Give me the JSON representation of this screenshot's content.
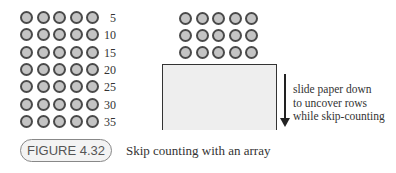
{
  "left_array": {
    "rows": 7,
    "cols": 5,
    "row_labels": [
      "5",
      "10",
      "15",
      "20",
      "25",
      "30",
      "35"
    ]
  },
  "right_array": {
    "visible_rows": 3,
    "cols": 5
  },
  "annotation": {
    "lines": [
      "slide paper down",
      "to uncover rows",
      "while skip-counting"
    ]
  },
  "figure": {
    "label": "FIGURE 4.32",
    "caption": "Skip counting with an array"
  }
}
